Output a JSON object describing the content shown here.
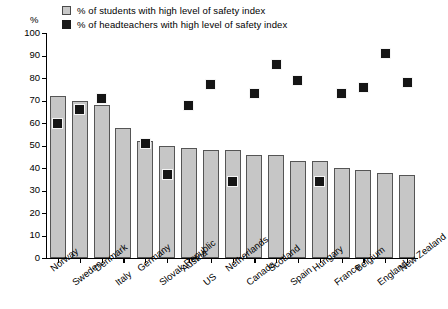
{
  "axis": {
    "unit_label": "%",
    "y_ticks": [
      0,
      10,
      20,
      30,
      40,
      50,
      60,
      70,
      80,
      90,
      100
    ]
  },
  "legend": {
    "items": [
      {
        "key": "students",
        "label": "% of students with high level of safety index",
        "color": "#c8c8c8"
      },
      {
        "key": "headteachers",
        "label": "% of headteachers with high level of safety index",
        "color": "#1a1a1a"
      }
    ]
  },
  "chart_data": {
    "type": "bar",
    "title": "",
    "subtitle": "",
    "xlabel": "",
    "ylabel": "%",
    "ylim": [
      0,
      100
    ],
    "ytick_step": 10,
    "grid": false,
    "legend_position": "top-left",
    "categories": [
      "Norway",
      "Sweden",
      "Denmark",
      "Italy",
      "Germany",
      "Slovak Republic",
      "Austria",
      "US",
      "Netherlands",
      "Canada",
      "Scotland",
      "Spain",
      "Hungary",
      "France",
      "Belgium",
      "England",
      "New Zealand"
    ],
    "series": [
      {
        "name": "% of students with high level of safety index",
        "type": "bar",
        "color": "#c6c6c6",
        "values": [
          72,
          70,
          68,
          58,
          52,
          50,
          49,
          48,
          48,
          46,
          46,
          43,
          43,
          40,
          39,
          38,
          37
        ]
      },
      {
        "name": "% of headteachers with high level of safety index",
        "type": "scatter",
        "color": "#151515",
        "values": [
          60,
          66,
          71,
          null,
          51,
          37,
          68,
          77,
          34,
          73,
          86,
          79,
          34,
          73,
          76,
          91,
          78
        ]
      }
    ]
  }
}
